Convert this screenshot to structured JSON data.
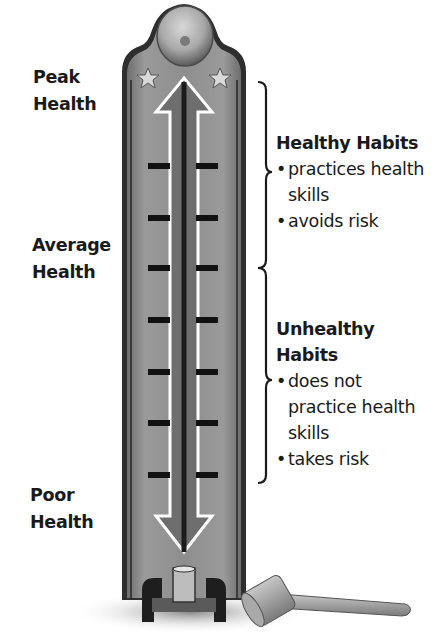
{
  "diagram": {
    "left_labels": [
      {
        "line1": "Peak",
        "line2": "Health"
      },
      {
        "line1": "Average",
        "line2": "Health"
      },
      {
        "line1": "Poor",
        "line2": "Health"
      }
    ],
    "healthy": {
      "title": "Healthy Habits",
      "bullets": [
        "practices health skills",
        "avoids risk"
      ]
    },
    "unhealthy": {
      "title_line1": "Unhealthy",
      "title_line2": "Habits",
      "bullets": [
        "does not practice health skills",
        "takes risk"
      ]
    },
    "tick_count": 7,
    "colors": {
      "tube": "#8c8c8c",
      "tube_edge": "#3a3a3a",
      "arrow_fill": "#6e6e6e",
      "arrow_outline": "#ffffff",
      "text": "#1a1a1a"
    }
  }
}
